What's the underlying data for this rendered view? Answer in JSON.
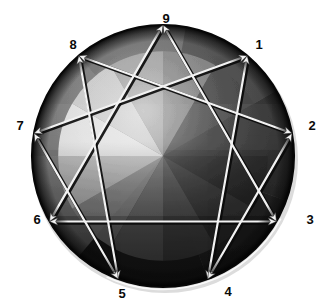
{
  "figure": {
    "title": "Enneagram",
    "type": "enneagram-diagram",
    "background_color": "#ffffff"
  },
  "circle": {
    "center_x": 163,
    "center_y": 156,
    "radius": 131,
    "rim_color": "#050505",
    "highlight_color": "#e8e8e8",
    "shadow_color": "#d8d8d8"
  },
  "style": {
    "line_color": "#f2f2f2",
    "line_shadow_color": "#0b0b0b",
    "line_width": 2.2,
    "arrow_color": "#f2f2f2",
    "label_color": "#0a0a0a"
  },
  "points": [
    {
      "id": "1",
      "label": "1",
      "angle_deg": 40,
      "label_x": 252,
      "label_y": 38
    },
    {
      "id": "2",
      "label": "2",
      "angle_deg": 80,
      "label_x": 305,
      "label_y": 119
    },
    {
      "id": "3",
      "label": "3",
      "angle_deg": 120,
      "label_x": 303,
      "label_y": 213
    },
    {
      "id": "4",
      "label": "4",
      "angle_deg": 160,
      "label_x": 221,
      "label_y": 285
    },
    {
      "id": "5",
      "label": "5",
      "angle_deg": 200,
      "label_x": 115,
      "label_y": 287
    },
    {
      "id": "6",
      "label": "6",
      "angle_deg": 240,
      "label_x": 30,
      "label_y": 213
    },
    {
      "id": "7",
      "label": "7",
      "angle_deg": 280,
      "label_x": 13,
      "label_y": 119
    },
    {
      "id": "8",
      "label": "8",
      "angle_deg": 320,
      "label_x": 66,
      "label_y": 38
    },
    {
      "id": "9",
      "label": "9",
      "angle_deg": 0,
      "label_x": 159,
      "label_y": 12
    }
  ],
  "triangle": {
    "name": "inner-triangle",
    "sequence": [
      "9",
      "3",
      "6",
      "9"
    ],
    "edges": [
      {
        "from": "9",
        "to": "3"
      },
      {
        "from": "3",
        "to": "6"
      },
      {
        "from": "6",
        "to": "9"
      }
    ]
  },
  "hexad": {
    "name": "hexad-path",
    "sequence": [
      "1",
      "4",
      "2",
      "8",
      "5",
      "7",
      "1"
    ],
    "edges": [
      {
        "from": "1",
        "to": "4"
      },
      {
        "from": "4",
        "to": "2"
      },
      {
        "from": "2",
        "to": "8"
      },
      {
        "from": "8",
        "to": "5"
      },
      {
        "from": "5",
        "to": "7"
      },
      {
        "from": "7",
        "to": "1"
      }
    ]
  },
  "facets": [
    {
      "start_deg": -90,
      "end_deg": -60,
      "fill": "#efefef"
    },
    {
      "start_deg": -60,
      "end_deg": -30,
      "fill": "#d3d3d3"
    },
    {
      "start_deg": -30,
      "end_deg": 0,
      "fill": "#9d9d9d"
    },
    {
      "start_deg": 0,
      "end_deg": 30,
      "fill": "#7b7b7b"
    },
    {
      "start_deg": 30,
      "end_deg": 60,
      "fill": "#3a3a3a"
    },
    {
      "start_deg": 60,
      "end_deg": 90,
      "fill": "#2c2c2c"
    },
    {
      "start_deg": 90,
      "end_deg": 120,
      "fill": "#232323"
    },
    {
      "start_deg": 120,
      "end_deg": 150,
      "fill": "#343434"
    },
    {
      "start_deg": 150,
      "end_deg": 180,
      "fill": "#4e4e4e"
    },
    {
      "start_deg": 180,
      "end_deg": 210,
      "fill": "#6e6e6e"
    },
    {
      "start_deg": 210,
      "end_deg": 240,
      "fill": "#8c8c8c"
    },
    {
      "start_deg": 240,
      "end_deg": 270,
      "fill": "#c0c0c0"
    }
  ],
  "outer_bands": [
    {
      "start_deg": -140,
      "end_deg": -90,
      "fill": "#767676"
    },
    {
      "start_deg": -90,
      "end_deg": -40,
      "fill": "#6c6c6c"
    },
    {
      "start_deg": -40,
      "end_deg": 10,
      "fill": "#606060"
    },
    {
      "start_deg": 10,
      "end_deg": 60,
      "fill": "#3f3f3f"
    },
    {
      "start_deg": 60,
      "end_deg": 110,
      "fill": "#2b2b2b"
    },
    {
      "start_deg": 110,
      "end_deg": 160,
      "fill": "#252525"
    },
    {
      "start_deg": 160,
      "end_deg": 220,
      "fill": "#1e1e1e"
    }
  ]
}
